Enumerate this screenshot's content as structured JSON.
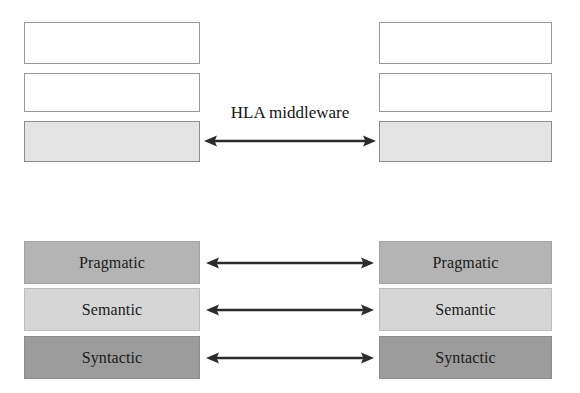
{
  "figure": {
    "caption": "HLA middleware",
    "background_color": "#ffffff"
  },
  "palette": {
    "empty_box": "#ffffff",
    "shaded_light": "#e4e4e4",
    "pragmatic": "#b4b4b4",
    "semantic": "#d6d6d6",
    "syntactic": "#9c9c9c",
    "border": "#8a8a8a",
    "arrow": "#2b2b2b",
    "text": "#1a1a1a"
  },
  "top_section": {
    "left_stack": {
      "name": "left-federate-stack",
      "boxes": [
        {
          "label": "",
          "fill": "empty"
        },
        {
          "label": "",
          "fill": "empty"
        },
        {
          "label": "",
          "fill": "shaded-light"
        }
      ]
    },
    "right_stack": {
      "name": "right-federate-stack",
      "boxes": [
        {
          "label": "",
          "fill": "empty"
        },
        {
          "label": "",
          "fill": "empty"
        },
        {
          "label": "",
          "fill": "shaded-light"
        }
      ]
    },
    "connector": {
      "label": "HLA middleware",
      "arrow_type": "double-headed-horizontal",
      "icon": "double-arrow-icon"
    }
  },
  "bottom_section": {
    "left_stack": {
      "name": "left-interoperability-levels",
      "boxes": [
        {
          "label": "Pragmatic",
          "fill": "pragmatic"
        },
        {
          "label": "Semantic",
          "fill": "semantic"
        },
        {
          "label": "Syntactic",
          "fill": "syntactic"
        }
      ]
    },
    "right_stack": {
      "name": "right-interoperability-levels",
      "boxes": [
        {
          "label": "Pragmatic",
          "fill": "pragmatic"
        },
        {
          "label": "Semantic",
          "fill": "semantic"
        },
        {
          "label": "Syntactic",
          "fill": "syntactic"
        }
      ]
    },
    "connectors": [
      {
        "level": "Pragmatic",
        "arrow_type": "double-headed-horizontal",
        "icon": "double-arrow-icon"
      },
      {
        "level": "Semantic",
        "arrow_type": "double-headed-horizontal",
        "icon": "double-arrow-icon"
      },
      {
        "level": "Syntactic",
        "arrow_type": "double-headed-horizontal",
        "icon": "double-arrow-icon"
      }
    ]
  }
}
